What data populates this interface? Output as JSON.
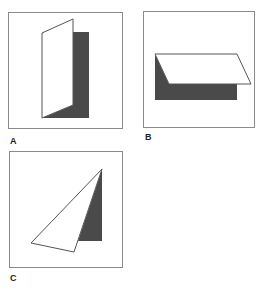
{
  "figure": {
    "panels": [
      {
        "id": "A",
        "label": "A",
        "description": "Folded card standing vertically with shadow to the right"
      },
      {
        "id": "B",
        "label": "B",
        "description": "Folded card lying horizontally with shadow below"
      },
      {
        "id": "C",
        "label": "C",
        "description": "Triangular sheet with shadow to the right"
      }
    ],
    "colors": {
      "paper": "#ffffff",
      "shadow": "#4a4a4a",
      "outline": "#555555",
      "frame": "#8a8a8a"
    }
  }
}
